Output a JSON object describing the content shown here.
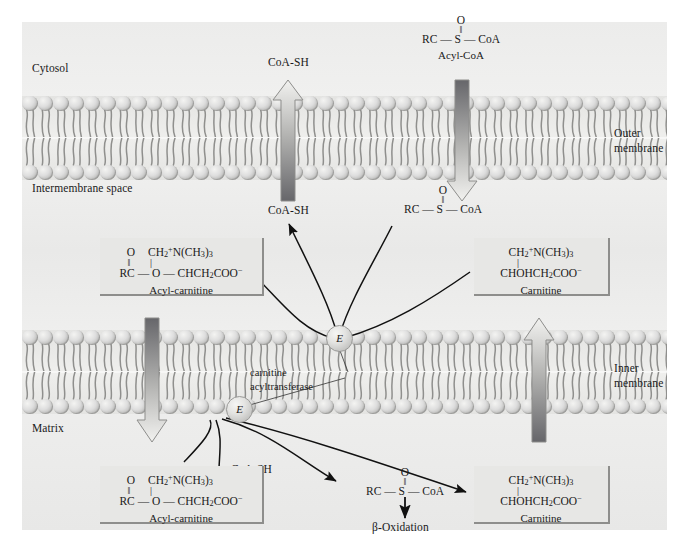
{
  "diagram": {
    "compartments": [
      {
        "name": "Cytosol",
        "label": "Cytosol"
      },
      {
        "name": "Intermembrane space",
        "label": "Intermembrane space"
      },
      {
        "name": "Matrix",
        "label": "Matrix"
      }
    ],
    "membranes": [
      {
        "label_line1": "Outer",
        "label_line2": "membrane"
      },
      {
        "label_line1": "Inner",
        "label_line2": "membrane"
      }
    ],
    "enzyme": {
      "symbol": "E",
      "label_line1": "carnitine",
      "label_line2": "acyltransferase"
    },
    "molecules": {
      "coash_cytosol": "CoA-SH",
      "coash_intermembrane": "CoA-SH",
      "coash_matrix": "CoA-SH",
      "acyl_coa_name": "Acyl-CoA",
      "beta_oxidation": "β-Oxidation",
      "acyl_carnitine_name": "Acyl-carnitine",
      "carnitine_name": "Carnitine"
    },
    "formulas": {
      "acyl_coa_top_o": "O",
      "acyl_coa_top_bond": "‖",
      "acyl_coa_chain": "RC — S — CoA",
      "acyl_carnitine_o": "O",
      "acyl_carnitine_bond": "‖",
      "acyl_carnitine_head": "CH2N(CH3)3",
      "acyl_carnitine_stick": "|",
      "acyl_carnitine_chain": "RC — O — CHCH2COO−",
      "carnitine_head": "CH2N(CH3)3",
      "carnitine_stick": "|",
      "carnitine_chain": "CHOHCH2COO−"
    },
    "arrows": {
      "coash_up_direction": "up",
      "acyl_coa_down_direction": "down",
      "acyl_carnitine_down_direction": "down",
      "carnitine_up_direction": "up"
    },
    "colors": {
      "background": "#ececeb",
      "membrane_head": "#dedede",
      "box_fill": "#e7e7e5",
      "arrow_dark": "#6e6e6c",
      "arrow_light": "#f0f0ee",
      "text": "#1a1a1a"
    }
  }
}
